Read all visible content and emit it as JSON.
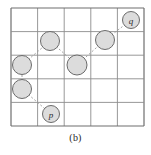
{
  "figure": {
    "caption": "(b)",
    "grid": {
      "rows": 5,
      "cols": 5,
      "x0": 11,
      "y0": 8,
      "cell_w": 26.6,
      "cell_h": 23.6,
      "line_color": "#8c8c8c",
      "border_color": "#6e6e6e",
      "background": "#ffffff"
    },
    "style": {
      "node_fill": "#dcdcdc",
      "node_stroke": "#6b6b6b",
      "edge_color": "#9a9a9a",
      "edge_dash": "2 2",
      "label_color": "#2a2a2a"
    },
    "nodes": [
      {
        "id": "n1",
        "label": "p",
        "cx": 51,
        "cy": 114,
        "r": 8.5,
        "labelled": true
      },
      {
        "id": "n2",
        "label": "",
        "cx": 22,
        "cy": 89,
        "r": 9.5,
        "labelled": false
      },
      {
        "id": "n3",
        "label": "",
        "cx": 22,
        "cy": 65,
        "r": 9.5,
        "labelled": false
      },
      {
        "id": "n4",
        "label": "",
        "cx": 50,
        "cy": 41,
        "r": 9.5,
        "labelled": false
      },
      {
        "id": "n5",
        "label": "",
        "cx": 77,
        "cy": 65,
        "r": 10,
        "labelled": false
      },
      {
        "id": "n6",
        "label": "",
        "cx": 105,
        "cy": 40,
        "r": 9.5,
        "labelled": false
      },
      {
        "id": "n7",
        "label": "q",
        "cx": 131,
        "cy": 20,
        "r": 8.5,
        "labelled": true
      }
    ],
    "edges": [
      {
        "from": "n1",
        "to": "n2"
      },
      {
        "from": "n2",
        "to": "n3"
      },
      {
        "from": "n3",
        "to": "n4"
      },
      {
        "from": "n4",
        "to": "n5"
      },
      {
        "from": "n5",
        "to": "n6"
      },
      {
        "from": "n6",
        "to": "n7"
      }
    ]
  }
}
